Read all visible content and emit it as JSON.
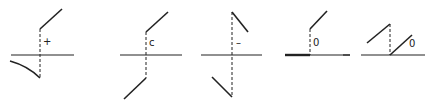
{
  "diagram": {
    "stroke_color": "#222222",
    "panels": [
      {
        "id": "plus",
        "label": "+"
      },
      {
        "id": "c",
        "label": "c"
      },
      {
        "id": "minus",
        "label": "–"
      },
      {
        "id": "zero-a",
        "label": "0"
      },
      {
        "id": "zero-b",
        "label": "0"
      }
    ]
  }
}
